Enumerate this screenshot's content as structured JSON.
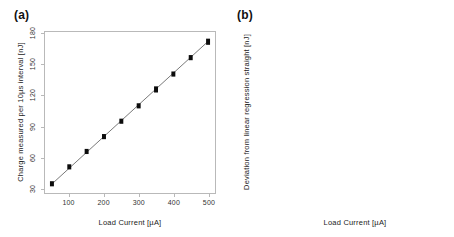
{
  "figure": {
    "panels": [
      {
        "tag": "(a)",
        "name": "charge-vs-load-current"
      },
      {
        "tag": "(b)",
        "name": "deviation-boxplots"
      }
    ]
  },
  "chart_data": [
    {
      "type": "scatter",
      "panel": "(a)",
      "title": "",
      "xlabel": "Load Current [µA]",
      "ylabel": "Charge measured per 10µs interval [nJ]",
      "xlim": [
        30,
        520
      ],
      "ylim": [
        25,
        182
      ],
      "xticks": [
        100,
        200,
        300,
        400,
        500
      ],
      "xticklabels": [
        "100",
        "200",
        "300",
        "400",
        "500"
      ],
      "yticks": [
        30,
        60,
        90,
        120,
        150,
        180
      ],
      "yticklabels": [
        "30",
        "60",
        "90",
        "120",
        "150",
        "180"
      ],
      "grid": false,
      "legend": null,
      "x": [
        50,
        100,
        150,
        200,
        250,
        300,
        350,
        400,
        450,
        500
      ],
      "values": [
        34,
        50.5,
        65.5,
        80,
        95,
        110,
        126,
        141,
        157,
        172.5
      ],
      "spread_low": [
        31.5,
        48,
        63,
        77.5,
        92.5,
        107.5,
        123,
        138.5,
        154.5,
        169.5
      ],
      "spread_high": [
        36.5,
        53,
        68,
        82.5,
        97.5,
        112.5,
        129,
        143.5,
        159.5,
        175.5
      ],
      "fit_line": {
        "style": "solid",
        "color": "#555555",
        "x0": 50,
        "y0": 33.8,
        "x1": 500,
        "y1": 172.8
      },
      "marker": {
        "shape": "vertical-bar",
        "color": "#0c0c0c",
        "width_px": 4
      }
    },
    {
      "type": "boxplot",
      "panel": "(b)",
      "title": "",
      "xlabel": "Load Current [µA]",
      "ylabel": "Deviation from linear regression straight [nJ]",
      "ylim": [
        -4.3,
        4.3
      ],
      "yticks": [
        -3.0,
        -1.5,
        0,
        1.5,
        3.0
      ],
      "yticklabels": [
        "-3.0",
        "-1.5",
        "0",
        "1.5",
        "3.0"
      ],
      "grid": false,
      "legend": null,
      "categories": [
        "50",
        "100",
        "150",
        "200",
        "250",
        "300",
        "350",
        "400",
        "450",
        "500"
      ],
      "boxes": [
        {
          "category": "50",
          "whisker_low": -3.4,
          "q1": -1.25,
          "median": 0.2,
          "q3": 1.7,
          "whisker_high": 3.65
        },
        {
          "category": "100",
          "whisker_low": -3.75,
          "q1": -1.45,
          "median": 0.15,
          "q3": 1.75,
          "whisker_high": 3.8
        },
        {
          "category": "150",
          "whisker_low": -3.6,
          "q1": -1.5,
          "median": -0.15,
          "q3": 1.45,
          "whisker_high": 3.7
        },
        {
          "category": "200",
          "whisker_low": -3.65,
          "q1": -1.5,
          "median": -0.2,
          "q3": 1.45,
          "whisker_high": 3.75
        },
        {
          "category": "250",
          "whisker_low": -3.95,
          "q1": -1.85,
          "median": -0.45,
          "q3": 1.2,
          "whisker_high": 3.7
        },
        {
          "category": "300",
          "whisker_low": -3.7,
          "q1": -1.55,
          "median": -0.3,
          "q3": 1.4,
          "whisker_high": 3.6
        },
        {
          "category": "350",
          "whisker_low": -3.6,
          "q1": -1.4,
          "median": -0.1,
          "q3": 1.5,
          "whisker_high": 3.85
        },
        {
          "category": "400",
          "whisker_low": -3.75,
          "q1": -1.35,
          "median": 0.0,
          "q3": 1.45,
          "whisker_high": 3.65
        },
        {
          "category": "450",
          "whisker_low": -3.45,
          "q1": -1.35,
          "median": 0.0,
          "q3": 1.5,
          "whisker_high": 3.7
        },
        {
          "category": "500",
          "whisker_low": -3.4,
          "q1": -1.3,
          "median": 0.05,
          "q3": 1.6,
          "whisker_high": 3.6
        }
      ],
      "style": {
        "box_edge_color": "#8a8a8a",
        "box_fill": "#ffffff",
        "median_color": "#3a3a3a",
        "whisker_style": "dotted",
        "whisker_color": "#aaaaaa",
        "cap_color": "#9a9a9a"
      }
    }
  ]
}
